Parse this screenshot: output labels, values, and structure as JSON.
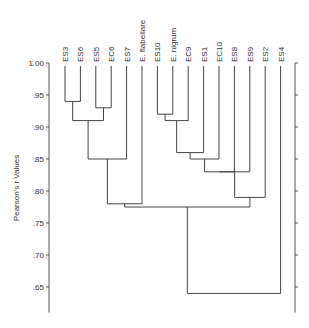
{
  "chart_data": {
    "type": "dendrogram",
    "title": "",
    "ylabel": "Pearson's r Values",
    "xlabel": "",
    "ylim": [
      0.61,
      1.0
    ],
    "yticks": [
      1.0,
      0.95,
      0.9,
      0.85,
      0.8,
      0.75,
      0.7,
      0.65
    ],
    "ytick_labels": [
      "1.00",
      ".95",
      ".90",
      ".85",
      ".80",
      ".75",
      ".70",
      ".65"
    ],
    "right_axis": true,
    "grid": false,
    "leaves": [
      "ES3",
      "ES6",
      "ES5",
      "EC6",
      "ES7",
      "E. flabellare",
      "ES10",
      "E. nigrum",
      "EC9",
      "ES1",
      "EC10",
      "ES8",
      "ES9",
      "ES2",
      "ES4"
    ],
    "merges": [
      {
        "a": "ES3",
        "b": "ES6",
        "value": 0.94,
        "id": "c1"
      },
      {
        "a": "ES5",
        "b": "EC6",
        "value": 0.93,
        "id": "c2"
      },
      {
        "a": "c1",
        "b": "c2",
        "value": 0.91,
        "id": "c3"
      },
      {
        "a": "c3",
        "b": "ES7",
        "value": 0.85,
        "id": "c4"
      },
      {
        "a": "c4",
        "b": "E. flabellare",
        "value": 0.78,
        "id": "c5"
      },
      {
        "a": "ES10",
        "b": "E. nigrum",
        "value": 0.92,
        "id": "c6"
      },
      {
        "a": "c6",
        "b": "EC9",
        "value": 0.91,
        "id": "c7"
      },
      {
        "a": "c7",
        "b": "ES1",
        "value": 0.86,
        "id": "c8"
      },
      {
        "a": "c8",
        "b": "EC10",
        "value": 0.85,
        "id": "c9"
      },
      {
        "a": "c9",
        "b": "ES8",
        "value": 0.83,
        "id": "c10"
      },
      {
        "a": "c10",
        "b": "ES9",
        "value": 0.83,
        "id": "c11"
      },
      {
        "a": "c11",
        "b": "ES2",
        "value": 0.79,
        "id": "c12"
      },
      {
        "a": "c5",
        "b": "c12",
        "value": 0.775,
        "id": "c13"
      },
      {
        "a": "c13",
        "b": "ES4",
        "value": 0.64,
        "id": "c14"
      }
    ]
  }
}
